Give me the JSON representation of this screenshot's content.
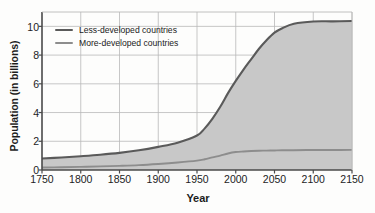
{
  "chart_data": {
    "type": "area",
    "title": "",
    "xlabel": "Year",
    "ylabel": "Population (in billions)",
    "xlim": [
      1750,
      2150
    ],
    "ylim": [
      0,
      11
    ],
    "xticks": [
      1750,
      1800,
      1850,
      1900,
      1950,
      2000,
      2050,
      2100,
      2150
    ],
    "yticks": [
      0,
      2,
      4,
      6,
      8,
      10
    ],
    "grid": true,
    "stacked": true,
    "legend_position": "top-left",
    "legend": [
      "Less-developed countries",
      "More-developed countries"
    ],
    "x": [
      1750,
      1775,
      1800,
      1825,
      1850,
      1875,
      1900,
      1925,
      1950,
      1960,
      1970,
      1980,
      1990,
      2000,
      2010,
      2020,
      2030,
      2040,
      2050,
      2060,
      2075,
      2100,
      2125,
      2150
    ],
    "series": [
      {
        "name": "More-developed countries",
        "color": "#8d8d8d",
        "values": [
          0.17,
          0.19,
          0.22,
          0.25,
          0.29,
          0.34,
          0.42,
          0.52,
          0.65,
          0.75,
          0.88,
          1.0,
          1.15,
          1.25,
          1.29,
          1.32,
          1.34,
          1.35,
          1.36,
          1.37,
          1.38,
          1.39,
          1.39,
          1.4
        ]
      },
      {
        "name": "Less-developed countries",
        "color": "#5a5a5a",
        "values": [
          0.63,
          0.68,
          0.74,
          0.81,
          0.9,
          1.03,
          1.19,
          1.38,
          1.75,
          2.15,
          2.7,
          3.4,
          4.2,
          4.95,
          5.7,
          6.4,
          7.1,
          7.7,
          8.2,
          8.5,
          8.8,
          8.95,
          8.96,
          8.97
        ]
      }
    ],
    "totals": [
      0.8,
      0.87,
      0.96,
      1.06,
      1.19,
      1.37,
      1.61,
      1.9,
      2.4,
      2.9,
      3.58,
      4.4,
      5.35,
      6.2,
      6.99,
      7.72,
      8.44,
      9.05,
      9.56,
      9.87,
      10.18,
      10.34,
      10.35,
      10.37
    ],
    "colors": {
      "fill": "#c8c8c8",
      "upper_line": "#5a5a5a",
      "lower_line": "#8d8d8d",
      "grid": "#b9b9b9",
      "axis": "#4a4a4a",
      "text": "#1c1c1c"
    }
  }
}
